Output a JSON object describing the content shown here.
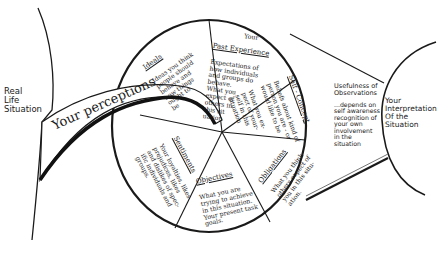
{
  "diagram": {
    "left_label": "Real\nLife\nSituation",
    "arrow_label": "Your perceptions",
    "right_label": "Your\nInterpretation\nOf the\nSituation",
    "middle_note": {
      "title": "Usefulness of\nObservations",
      "body": "...depends on\nself awareness\nrecognition of\nyour own\ninvolvement\nin the\nsituation"
    },
    "segments": [
      {
        "id": "ideals",
        "title": "Ideals",
        "body": "Ideas you think\npeople should\nbehave and\nhow things\nought to\nbe"
      },
      {
        "id": "past-experience",
        "title_prefix": "Your",
        "title": "Past Experience",
        "body": "Expectations of\nhow individuals\nand groups do\nbehave.\nWhat you\nexpect of\nothers in\nthis sit\nuation"
      },
      {
        "id": "self-concept",
        "title": "Self - Concept",
        "body": "Beliefs about kind of\nperson you are - or\nwould like to be\n\nWhat you ex-\npect of your-\nself in this\nsituation"
      },
      {
        "id": "obligations",
        "title": "Obligations",
        "body": "What you think\nothers expect of\nyou in this situ-\nation."
      },
      {
        "id": "objectives",
        "title": "Objectives",
        "body": "What you are\ntrying to achieve\nin this situation.\nYour present task\ngoals."
      },
      {
        "id": "sentiments",
        "title": "Sentiments",
        "body": "Your loyalties, likes\nprejudices, likes\nand dislikes of spec-\nific individuals and\ngroups."
      }
    ]
  }
}
